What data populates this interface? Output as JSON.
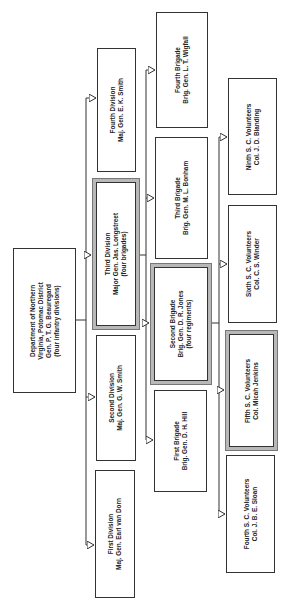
{
  "diagram": {
    "type": "org-chart",
    "orientation": "rotated-90-ccw",
    "nodes": {
      "department": {
        "lines": [
          "Department of Northern",
          "Virginia, Potomac District",
          "Gen. P. T. G. Beauregard",
          "(four infantry divisions)"
        ],
        "highlighted": false
      },
      "div1": {
        "lines": [
          "First Division",
          "Maj. Gen. Earl van Dorn"
        ],
        "highlighted": false
      },
      "div2": {
        "lines": [
          "Second Division",
          "Maj. Gen. G. W. Smith"
        ],
        "highlighted": false
      },
      "div3": {
        "lines": [
          "Third Division",
          "Major Gen. Jas. Longstreet",
          "(four brigades)"
        ],
        "highlighted": true
      },
      "div4": {
        "lines": [
          "Fourth Division",
          "Maj. Gen. E. K. Smith"
        ],
        "highlighted": false
      },
      "brig1": {
        "lines": [
          "First Brigade",
          "Brig. Gen. D. H. Hill"
        ],
        "highlighted": false
      },
      "brig2": {
        "lines": [
          "Second Brigade",
          "Brig. Gen. D. R. Jones",
          "(four regiments)"
        ],
        "highlighted": true
      },
      "brig3": {
        "lines": [
          "Third Brigade",
          "Brig. Gen. M. L. Bonham"
        ],
        "highlighted": false
      },
      "brig4": {
        "lines": [
          "Fourth Brigade",
          "Brig. Gen. L. T. Wigfall"
        ],
        "highlighted": false
      },
      "reg4": {
        "lines": [
          "Fourth S. C. Volunteers",
          "Col. J. B. E. Sloan"
        ],
        "highlighted": false
      },
      "reg5": {
        "lines": [
          "Fifth S. C. Volunteers",
          "Col. Micah Jenkins"
        ],
        "highlighted": true
      },
      "reg6": {
        "lines": [
          "Sixth S. C. Volunteers",
          "Col. C. S. Winder"
        ],
        "highlighted": false
      },
      "reg9": {
        "lines": [
          "Ninth S. C. Volunteers",
          "Col. J. D. Blanding"
        ],
        "highlighted": false
      }
    },
    "edges": [
      [
        "department",
        "div1"
      ],
      [
        "department",
        "div2"
      ],
      [
        "department",
        "div3"
      ],
      [
        "department",
        "div4"
      ],
      [
        "div3",
        "brig1"
      ],
      [
        "div3",
        "brig2"
      ],
      [
        "div3",
        "brig3"
      ],
      [
        "div3",
        "brig4"
      ],
      [
        "brig2",
        "reg4"
      ],
      [
        "brig2",
        "reg5"
      ],
      [
        "brig2",
        "reg6"
      ],
      [
        "brig2",
        "reg9"
      ]
    ]
  }
}
